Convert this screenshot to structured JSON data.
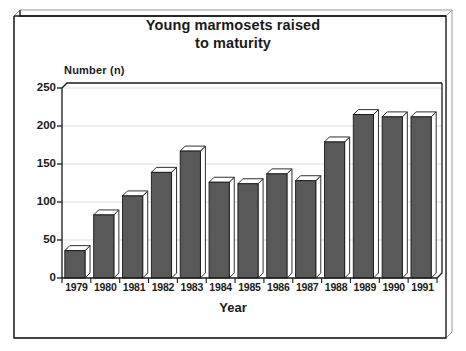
{
  "chart_data": {
    "type": "bar",
    "title": "Young marmosets raised to maturity",
    "title_lines": [
      "Young marmosets raised",
      "to maturity"
    ],
    "xlabel": "Year",
    "ylabel": "Number (n)",
    "categories": [
      "1979",
      "1980",
      "1981",
      "1982",
      "1983",
      "1984",
      "1985",
      "1986",
      "1987",
      "1988",
      "1989",
      "1990",
      "1991"
    ],
    "values": [
      36,
      83,
      108,
      139,
      167,
      126,
      124,
      137,
      128,
      179,
      215,
      212,
      212
    ],
    "ylim": [
      0,
      250
    ],
    "yticks": [
      0,
      50,
      100,
      150,
      200,
      250
    ],
    "ytick_labels": [
      "0",
      "50",
      "100",
      "150",
      "200",
      "250"
    ],
    "grid": true,
    "legend": "none",
    "style": "3d-bar",
    "colors": {
      "bar_face": "#595959",
      "bar_top": "#ffffff",
      "bar_side": "#ffffff",
      "bar_outline": "#1a1a1a",
      "axis": "#1a1a1a",
      "grid": "#d9d9d9",
      "text": "#1a1a1a",
      "background": "#ffffff"
    }
  }
}
